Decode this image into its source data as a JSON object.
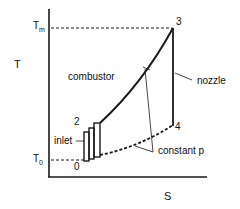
{
  "diagram": {
    "type": "T-s diagram (ramjet cycle)",
    "axes": {
      "y_label": "T",
      "x_label": "S"
    },
    "levels": {
      "t_max": {
        "main": "T",
        "sub": "m"
      },
      "t_zero": {
        "main": "T",
        "sub": "0"
      }
    },
    "points": {
      "p0": "0",
      "p2": "2",
      "p3": "3",
      "p4": "4"
    },
    "annotations": {
      "combustor": "combustor",
      "nozzle": "nozzle",
      "inlet": "inlet",
      "constant_p": "constant p"
    },
    "colors": {
      "line": "#1a1a1a",
      "background": "#ffffff"
    }
  }
}
